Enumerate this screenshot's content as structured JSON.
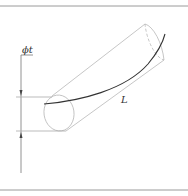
{
  "diagram": {
    "labels": {
      "diameter": "ϕt",
      "length": "L"
    },
    "colors": {
      "frame": "#999999",
      "thin": "#b5b5b5",
      "curve": "#333333",
      "dim": "#555555"
    }
  }
}
